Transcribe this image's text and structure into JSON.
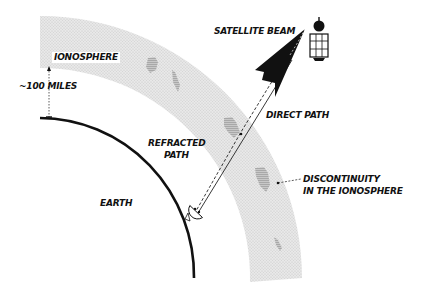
{
  "diagram": {
    "labels": {
      "ionosphere": "IONOSPHERE",
      "altitude": "~100 MILES",
      "satellite_beam": "SATELLITE BEAM",
      "direct_path": "DIRECT PATH",
      "refracted_path_line1": "REFRACTED",
      "refracted_path_line2": "PATH",
      "earth": "EARTH",
      "discontinuity_line1": "DISCONTINUITY",
      "discontinuity_line2": "IN THE IONOSPHERE"
    },
    "elements": [
      {
        "id": "earth",
        "type": "arc",
        "description": "Earth surface curve"
      },
      {
        "id": "ionosphere",
        "type": "shaded-band",
        "description": "Ionosphere layer ~100 miles above Earth"
      },
      {
        "id": "satellite",
        "type": "icon",
        "description": "Satellite with solar panel grid"
      },
      {
        "id": "satellite-beam",
        "type": "arrow",
        "description": "Black arrow representing satellite beam"
      },
      {
        "id": "ground-dish",
        "type": "icon",
        "description": "Ground station dish antenna"
      },
      {
        "id": "direct-path",
        "type": "line",
        "style": "solid",
        "description": "Direct path from satellite to dish"
      },
      {
        "id": "refracted-path",
        "type": "line",
        "style": "dashed",
        "description": "Refracted path via ionospheric discontinuity"
      },
      {
        "id": "discontinuities",
        "type": "patches",
        "count": 5,
        "description": "Irregular darker patches in ionosphere"
      }
    ],
    "colors": {
      "ionosphere_fill": "#e4e4e4",
      "patch_fill": "#b8b8b8",
      "ink": "#111111"
    }
  }
}
